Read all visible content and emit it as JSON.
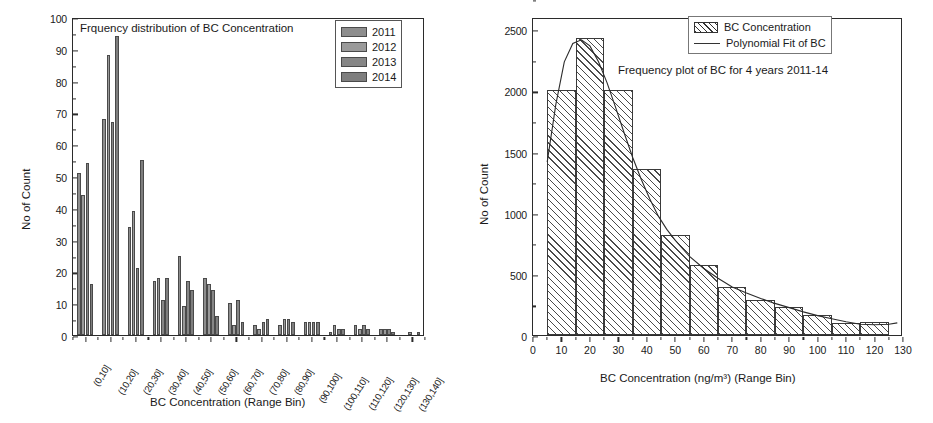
{
  "chart_data": [
    {
      "type": "bar",
      "id": "left-grouped-bar",
      "title": "Frquency distribution of BC Concentration",
      "xlabel": "BC Concentration (Range Bin)",
      "ylabel": "No of Count",
      "ylim": [
        0,
        100
      ],
      "ytick_step": 10,
      "yticks": [
        0,
        10,
        20,
        30,
        40,
        50,
        60,
        70,
        80,
        90,
        100
      ],
      "grid": false,
      "legend_position": "top-right",
      "categories": [
        "(0,10]",
        "(10,20]",
        "(20,30]",
        "(30,40]",
        "(40,50]",
        "(50,60]",
        "(60,70]",
        "(70,80]",
        "(80,90]",
        "(90,100]",
        "(100,110]",
        "(110,120]",
        "(120,130]",
        "(130,140]"
      ],
      "series": [
        {
          "name": "2011",
          "color": "#8d8d8d",
          "values": [
            51,
            68,
            34,
            17,
            25,
            18,
            10,
            3,
            3,
            4,
            1,
            3,
            2,
            0
          ]
        },
        {
          "name": "2012",
          "color": "#9a9a9a",
          "values": [
            44,
            88,
            39,
            18,
            9,
            16,
            3,
            2,
            5,
            4,
            3,
            2,
            2,
            1
          ]
        },
        {
          "name": "2013",
          "color": "#868686",
          "values": [
            54,
            67,
            21,
            11,
            17,
            14,
            11,
            4,
            5,
            4,
            2,
            3,
            2,
            0
          ]
        },
        {
          "name": "2014",
          "color": "#7e7e7e",
          "values": [
            16,
            94,
            55,
            18,
            14,
            6,
            4,
            5,
            4,
            4,
            2,
            2,
            1,
            1
          ]
        }
      ]
    },
    {
      "type": "bar",
      "id": "right-histogram",
      "title": "",
      "annotation": "Frequency plot of  BC for 4 years 2011-14",
      "xlabel": "BC Concentration (ng/m³) (Range Bin)",
      "ylabel": "No of Count",
      "xlim": [
        0,
        130
      ],
      "ylim": [
        0,
        2600
      ],
      "xticks": [
        0,
        10,
        20,
        30,
        40,
        50,
        60,
        70,
        80,
        90,
        100,
        110,
        120,
        130
      ],
      "yticks": [
        0,
        500,
        1000,
        1500,
        2000,
        2500
      ],
      "ytick_step": 500,
      "grid": false,
      "legend_position": "top-right",
      "legend_entries": [
        {
          "label": "BC Concentration",
          "style": "hatched-bar"
        },
        {
          "label": "Polynomial Fit of BC",
          "style": "line"
        }
      ],
      "bin_edges": [
        5,
        15,
        25,
        35,
        45,
        55,
        65,
        75,
        85,
        95,
        105,
        115,
        125
      ],
      "values": [
        2000,
        2430,
        2000,
        1360,
        820,
        570,
        390,
        290,
        230,
        160,
        100,
        110
      ],
      "fit_curve": [
        [
          5,
          1430
        ],
        [
          8,
          1900
        ],
        [
          11,
          2250
        ],
        [
          14,
          2400
        ],
        [
          17,
          2430
        ],
        [
          20,
          2380
        ],
        [
          23,
          2250
        ],
        [
          26,
          2080
        ],
        [
          29,
          1880
        ],
        [
          32,
          1670
        ],
        [
          35,
          1470
        ],
        [
          38,
          1290
        ],
        [
          41,
          1130
        ],
        [
          44,
          990
        ],
        [
          47,
          880
        ],
        [
          50,
          790
        ],
        [
          55,
          660
        ],
        [
          60,
          560
        ],
        [
          65,
          480
        ],
        [
          70,
          410
        ],
        [
          75,
          360
        ],
        [
          80,
          315
        ],
        [
          85,
          275
        ],
        [
          90,
          240
        ],
        [
          95,
          205
        ],
        [
          100,
          175
        ],
        [
          105,
          150
        ],
        [
          110,
          125
        ],
        [
          115,
          105
        ],
        [
          120,
          100
        ],
        [
          125,
          105
        ],
        [
          128,
          115
        ]
      ]
    }
  ]
}
